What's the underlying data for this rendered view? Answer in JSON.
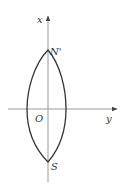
{
  "diagram": {
    "type": "coordinate-plot",
    "axes": {
      "vertical_label": "x",
      "horizontal_label": "y",
      "origin_label": "O"
    },
    "points": {
      "top": "N'",
      "bottom": "S"
    },
    "colors": {
      "axis": "#999999",
      "curve": "#333333",
      "text": "#333333"
    }
  }
}
